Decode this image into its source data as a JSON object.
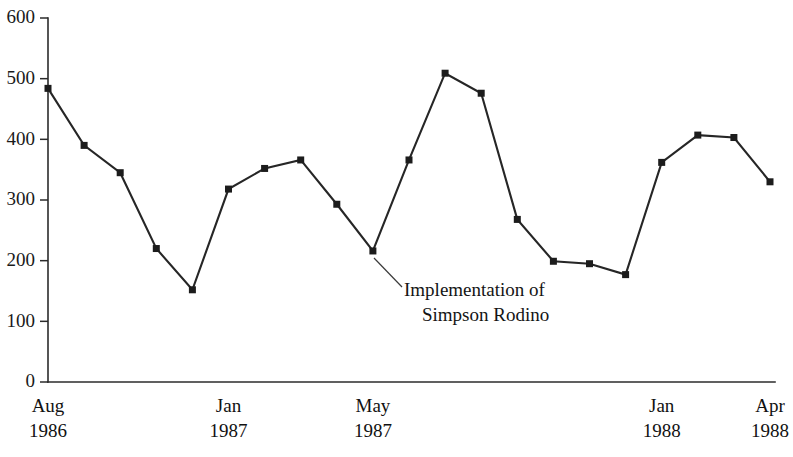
{
  "chart_data": {
    "type": "line",
    "title": "",
    "subtitle": "",
    "xlabel": "",
    "ylabel": "",
    "ylim": [
      0,
      600
    ],
    "y_ticks": [
      0,
      100,
      200,
      300,
      400,
      500,
      600
    ],
    "grid": false,
    "legend": null,
    "legend_position": "none",
    "x_tick_labels": [
      {
        "line1": "Aug",
        "line2": "1986",
        "index": 0
      },
      {
        "line1": "Jan",
        "line2": "1987",
        "index": 5
      },
      {
        "line1": "May",
        "line2": "1987",
        "index": 9
      },
      {
        "line1": "Jan",
        "line2": "1988",
        "index": 17
      },
      {
        "line1": "Apr",
        "line2": "1988",
        "index": 20
      }
    ],
    "categories": [
      "Aug 1986",
      "Sep 1986",
      "Oct 1986",
      "Nov 1986",
      "Dec 1986",
      "Jan 1987",
      "Feb 1987",
      "Mar 1987",
      "Apr 1987",
      "May 1987",
      "Jun 1987",
      "Jul 1987",
      "Aug 1987",
      "Sep 1987",
      "Oct 1987",
      "Nov 1987",
      "Dec 1987",
      "Jan 1988",
      "Feb 1988",
      "Mar 1988",
      "Apr 1988"
    ],
    "values": [
      484,
      390,
      345,
      220,
      152,
      318,
      352,
      366,
      293,
      216,
      366,
      509,
      476,
      268,
      199,
      195,
      177,
      362,
      407,
      403,
      330
    ],
    "annotations": [
      {
        "line1": "Implementation of",
        "line2": "Simpson Rodino",
        "points_to_index": 9,
        "text_x": 404,
        "text_y": 296,
        "leader_from_x": 374,
        "leader_from_y": 258,
        "leader_to_x": 402,
        "leader_to_y": 287
      }
    ],
    "colors": {
      "line": "#262626",
      "marker": "#1c1c1c",
      "axis": "#2b2b2b",
      "text": "#141414",
      "background": "#ffffff"
    }
  },
  "geometry": {
    "plot_left": 48,
    "plot_right": 775,
    "y_zero_px": 382,
    "y_top_px": 18,
    "y_top_value": 600,
    "point_spacing": 36.1,
    "marker_size": 7,
    "tick_length": 8,
    "xlabel_line1_y": 412,
    "xlabel_line2_y": 437
  }
}
